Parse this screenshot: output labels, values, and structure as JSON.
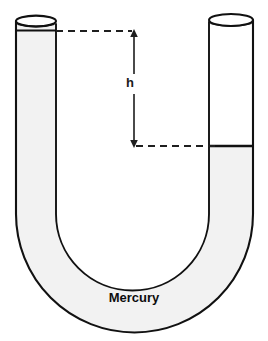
{
  "diagram": {
    "type": "physics-apparatus",
    "labels": {
      "height_symbol": "h",
      "fluid_name": "Mercury"
    },
    "colors": {
      "outline": "#111111",
      "mercury_fill": "#f2f2f2",
      "air_fill": "#ffffff",
      "background": "#ffffff",
      "dimension_line": "#3a3a3a",
      "text": "#0d0d0d"
    },
    "geometry": {
      "left_tube": {
        "x_left": 16,
        "x_right": 56,
        "top_y": 21,
        "mercury_surface_y": 31,
        "open_top": true,
        "filled": true
      },
      "right_tube": {
        "x_left": 209,
        "x_right": 253,
        "top_y": 20,
        "mercury_surface_y": 146,
        "open_top": true,
        "filled_from_y": 146
      },
      "u_bend": {
        "inner_radius": 62,
        "outer_radius": 104,
        "center_x": 134,
        "center_y": 214
      },
      "dimension": {
        "top_dash_y": 31,
        "bottom_dash_y": 146,
        "arrow_x": 134,
        "top_dash_x_start": 56,
        "top_dash_x_end": 134,
        "bottom_dash_x_start": 134,
        "bottom_dash_x_end": 216,
        "measured_span_px": 115
      }
    }
  }
}
